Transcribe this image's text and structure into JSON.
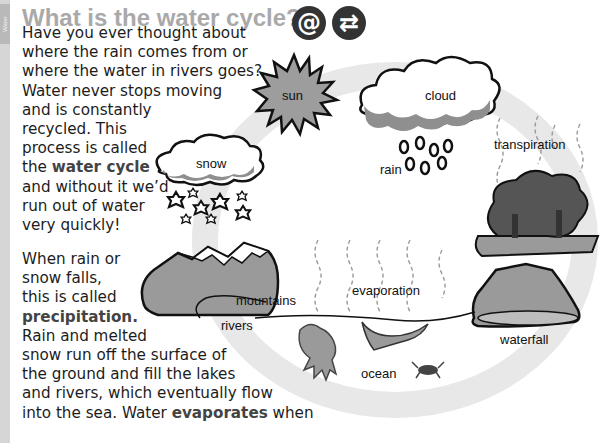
{
  "side_tab": {
    "label": "Water"
  },
  "header": {
    "title": "What is the water cycle?",
    "icons": [
      {
        "name": "at-icon",
        "glyph": "@"
      },
      {
        "name": "exchange-arrows-icon",
        "glyph": "⇄"
      }
    ]
  },
  "body_text": {
    "para1_lines": [
      "Have you ever thought about",
      "where the rain comes from or",
      "where the water in rivers goes?",
      "Water never stops moving",
      "and is constantly",
      "recycled. This",
      "process is called",
      "the ",
      "and without it we’d",
      "run out of water",
      "very quickly!"
    ],
    "para1_bold": "water cycle",
    "para2_lines": [
      "When rain or",
      "snow falls,",
      "this is called",
      "",
      "Rain and melted",
      "snow run off the surface of",
      "the ground and fill the lakes",
      "and rivers, which eventually flow",
      "into the sea. Water ",
      " when"
    ],
    "para2_bold_precipitation": "precipitation.",
    "para2_bold_evaporates": "evaporates"
  },
  "diagram": {
    "labels": {
      "sun": "sun",
      "cloud": "cloud",
      "rain": "rain",
      "snow": "snow",
      "transpiration": "transpiration",
      "mountains": "mountains",
      "rivers": "rivers",
      "evaporation": "evaporation",
      "ocean": "ocean",
      "waterfall": "waterfall"
    },
    "colors": {
      "ring": "#e6e6e6",
      "fill_gray": "#9a9a9a",
      "dark_gray": "#555555",
      "outline": "#111111",
      "title": "#a9a9a9"
    }
  }
}
